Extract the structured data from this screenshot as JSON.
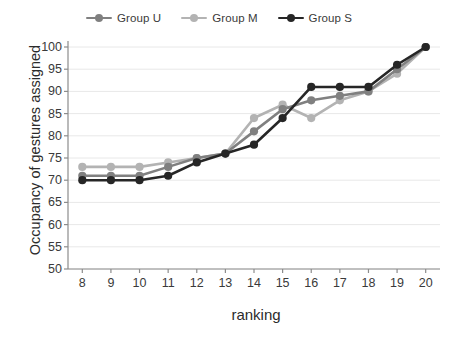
{
  "chart_data": {
    "type": "line",
    "title": "",
    "xlabel": "ranking",
    "ylabel": "Occupancy of gestures assigned",
    "x": [
      8,
      9,
      10,
      11,
      12,
      13,
      14,
      15,
      16,
      17,
      18,
      19,
      20
    ],
    "xlim": [
      7.5,
      20.5
    ],
    "ylim": [
      50,
      100
    ],
    "yticks": [
      50,
      55,
      60,
      65,
      70,
      75,
      80,
      85,
      90,
      95,
      100
    ],
    "xticks": [
      8,
      9,
      10,
      11,
      12,
      13,
      14,
      15,
      16,
      17,
      18,
      19,
      20
    ],
    "grid": true,
    "legend_position": "top",
    "series": [
      {
        "name": "Group U",
        "color": "#808080",
        "values": [
          71,
          71,
          71,
          73,
          75,
          76,
          81,
          86,
          88,
          89,
          90,
          95,
          100
        ]
      },
      {
        "name": "Group M",
        "color": "#b3b3b3",
        "values": [
          73,
          73,
          73,
          74,
          75,
          76,
          84,
          87,
          84,
          88,
          90,
          94,
          100
        ]
      },
      {
        "name": "Group S",
        "color": "#262626",
        "values": [
          70,
          70,
          70,
          71,
          74,
          76,
          78,
          84,
          91,
          91,
          91,
          96,
          100
        ]
      }
    ]
  },
  "axis": {
    "y_tick_labels": [
      "100",
      "95",
      "90",
      "85",
      "80",
      "75",
      "70",
      "65",
      "60",
      "55",
      "50"
    ],
    "x_tick_labels": [
      "8",
      "9",
      "10",
      "11",
      "12",
      "13",
      "14",
      "15",
      "16",
      "17",
      "18",
      "19",
      "20"
    ],
    "y_title": "Occupancy of gestures assigned",
    "x_title": "ranking"
  },
  "legend": {
    "items": [
      {
        "label": "Group U",
        "color": "#808080"
      },
      {
        "label": "Group M",
        "color": "#b3b3b3"
      },
      {
        "label": "Group S",
        "color": "#262626"
      }
    ]
  }
}
